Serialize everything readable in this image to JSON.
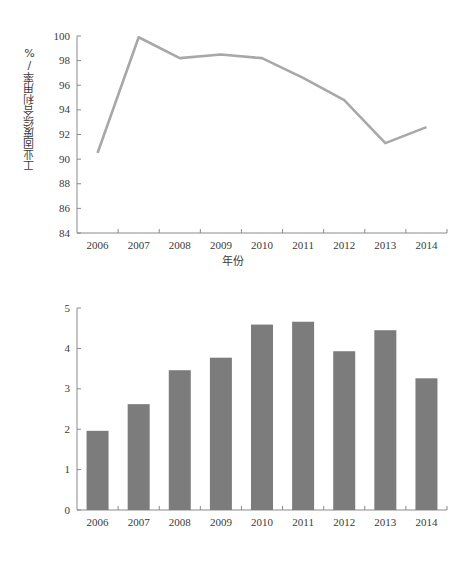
{
  "chart_data": [
    {
      "type": "line",
      "id": "industrial-solid-waste-utilization-rate",
      "title": "",
      "xlabel": "年份",
      "ylabel": "工业固废综合利用率/%",
      "categories": [
        "2006",
        "2007",
        "2008",
        "2009",
        "2010",
        "2011",
        "2012",
        "2013",
        "2014"
      ],
      "values": [
        90.5,
        99.9,
        98.2,
        98.5,
        98.2,
        96.6,
        94.8,
        91.3,
        92.6
      ],
      "ylim": [
        84,
        100
      ],
      "yticks": [
        "84",
        "86",
        "88",
        "90",
        "92",
        "94",
        "96",
        "98",
        "100"
      ],
      "ytick_values": [
        84,
        86,
        88,
        90,
        92,
        94,
        96,
        98,
        100
      ],
      "grid": false,
      "legend": "none",
      "series_color": "#a8a8a8",
      "line_width": 2.6
    },
    {
      "type": "bar",
      "id": "industrial-hazardous-solid-waste-utilization-volume",
      "title": "",
      "xlabel": "年份",
      "ylabel": "工业危险固废综合利用量/万t",
      "categories": [
        "2006",
        "2007",
        "2008",
        "2009",
        "2010",
        "2011",
        "2012",
        "2013",
        "2014"
      ],
      "values": [
        1.96,
        2.62,
        3.46,
        3.77,
        4.59,
        4.66,
        3.93,
        4.45,
        3.26
      ],
      "ylim": [
        0,
        5
      ],
      "yticks": [
        "0",
        "1",
        "2",
        "3",
        "4",
        "5"
      ],
      "ytick_values": [
        0,
        1,
        2,
        3,
        4,
        5
      ],
      "grid": false,
      "legend": "none",
      "series_color": "#7c7c7c",
      "bar_width_px": 22
    }
  ],
  "figures": {
    "line": {
      "axis_color": "#8a8a8a",
      "background": "#ffffff"
    },
    "bar": {
      "axis_color": "#8a8a8a",
      "background": "#ffffff"
    }
  }
}
